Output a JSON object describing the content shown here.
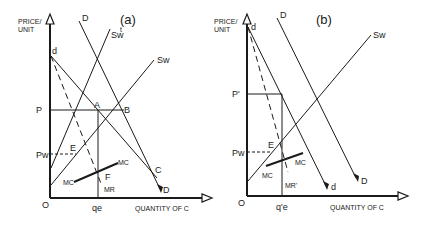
{
  "figure": {
    "panels": [
      {
        "id": "a",
        "title": "(a)",
        "y_axis_label_line1": "PRICE/",
        "y_axis_label_line2": "UNIT",
        "x_axis_label": "QUANTITY OF C",
        "origin_label": "O",
        "price_labels": {
          "p": "P",
          "pw": "Pw"
        },
        "quantity_label": "qe",
        "curve_labels": {
          "D_top": "D",
          "D_bottom": "D",
          "d": "d",
          "Swt": "Sw",
          "Swt_sup": "t",
          "Sw": "Sw",
          "MR": "MR",
          "MC_left": "MC",
          "MC_right": "MC"
        },
        "point_labels": {
          "A": "A",
          "B": "B",
          "C": "C",
          "E": "E",
          "F": "F"
        }
      },
      {
        "id": "b",
        "title": "(b)",
        "y_axis_label_line1": "PRICE/",
        "y_axis_label_line2": "UNIT",
        "x_axis_label": "QUANTITY OF C",
        "origin_label": "O",
        "price_labels": {
          "p": "P'",
          "pw": "Pw"
        },
        "quantity_label": "q'e",
        "curve_labels": {
          "D_top": "D",
          "D_bottom": "D",
          "d_top": "d",
          "d_bottom": "d",
          "Sw": "Sw",
          "MR": "MR'",
          "MC_left": "MC",
          "MC_right": "MC"
        },
        "point_labels": {
          "E": "E"
        }
      }
    ]
  }
}
